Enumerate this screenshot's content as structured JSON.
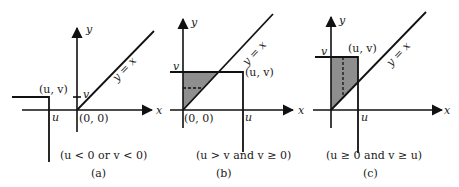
{
  "figure": {
    "colors": {
      "ink": "#111111",
      "shade": "#8e8e8e",
      "background": "#ffffff"
    },
    "panels": [
      {
        "id": "a",
        "axis_x_label": "x",
        "axis_y_label": "y",
        "line_label": "y = x",
        "point_label": "(u, v)",
        "origin_label": "(0, 0)",
        "u_label": "u",
        "v_label": "v",
        "condition": "(u < 0 or v < 0)",
        "caption": "(a)"
      },
      {
        "id": "b",
        "axis_x_label": "x",
        "axis_y_label": "y",
        "line_label": "y = x",
        "point_label": "(u, v)",
        "origin_label": "(0, 0)",
        "u_label": "u",
        "v_label": "v",
        "condition": "(u > v  and  v ≥ 0)",
        "caption": "(b)"
      },
      {
        "id": "c",
        "axis_x_label": "x",
        "axis_y_label": "y",
        "line_label": "y = x",
        "point_label": "(u, v)",
        "u_label": "u",
        "v_label": "v",
        "condition": "(u ≥ 0 and v ≥ u)",
        "caption": "(c)"
      }
    ]
  }
}
